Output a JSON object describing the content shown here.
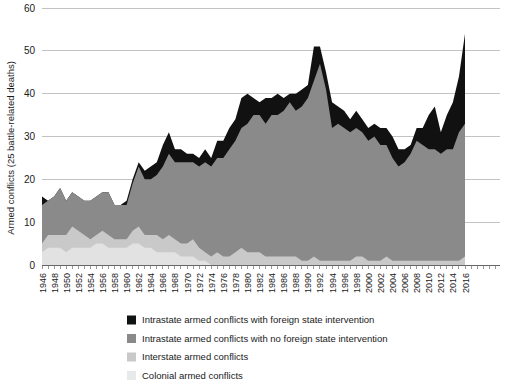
{
  "chart_data": {
    "type": "area",
    "stacked": true,
    "title": "",
    "xlabel": "",
    "ylabel": "Armed conflicts (25 battle-related deaths)",
    "ylim": [
      0,
      60
    ],
    "yticks": [
      0,
      10,
      20,
      30,
      40,
      50,
      60
    ],
    "xlim": [
      1946,
      2017
    ],
    "grid": "horizontal",
    "legend_position": "bottom-left",
    "x": [
      1946,
      1947,
      1948,
      1949,
      1950,
      1951,
      1952,
      1953,
      1954,
      1955,
      1956,
      1957,
      1958,
      1959,
      1960,
      1961,
      1962,
      1963,
      1964,
      1965,
      1966,
      1967,
      1968,
      1969,
      1970,
      1971,
      1972,
      1973,
      1974,
      1975,
      1976,
      1977,
      1978,
      1979,
      1980,
      1981,
      1982,
      1983,
      1984,
      1985,
      1986,
      1987,
      1988,
      1989,
      1990,
      1991,
      1992,
      1993,
      1994,
      1995,
      1996,
      1997,
      1998,
      1999,
      2000,
      2001,
      2002,
      2003,
      2004,
      2005,
      2006,
      2007,
      2008,
      2009,
      2010,
      2011,
      2012,
      2013,
      2014,
      2015,
      2016
    ],
    "xtick_labels": [
      "1946",
      "1948",
      "1950",
      "1952",
      "1954",
      "1956",
      "1958",
      "1960",
      "1962",
      "1964",
      "1966",
      "1968",
      "1970",
      "1972",
      "1974",
      "1976",
      "1978",
      "1980",
      "1982",
      "1984",
      "1986",
      "1988",
      "1990",
      "1992",
      "1994",
      "1996",
      "1998",
      "2000",
      "2002",
      "2004",
      "2006",
      "2008",
      "2010",
      "2012",
      "2014",
      "2016"
    ],
    "series": [
      {
        "name": "Colonial armed conflicts",
        "color": "#e2e2e2",
        "order": 1,
        "values": [
          3,
          4,
          4,
          4,
          3,
          4,
          4,
          4,
          4,
          5,
          5,
          4,
          4,
          4,
          4,
          5,
          5,
          4,
          4,
          3,
          3,
          3,
          3,
          2,
          2,
          2,
          1,
          1,
          0,
          0,
          0,
          0,
          0,
          0,
          0,
          0,
          0,
          0,
          0,
          0,
          0,
          0,
          0,
          0,
          0,
          0,
          0,
          0,
          0,
          0,
          0,
          0,
          0,
          0,
          0,
          0,
          0,
          0,
          0,
          0,
          0,
          0,
          0,
          0,
          0,
          0,
          0,
          0,
          0,
          0,
          0
        ]
      },
      {
        "name": "Interstate armed conflicts",
        "color": "#c9c9c9",
        "order": 2,
        "values": [
          2,
          3,
          3,
          3,
          4,
          5,
          4,
          3,
          2,
          2,
          3,
          3,
          2,
          2,
          2,
          3,
          4,
          3,
          3,
          4,
          3,
          4,
          3,
          3,
          3,
          4,
          3,
          2,
          2,
          3,
          2,
          2,
          3,
          4,
          3,
          3,
          3,
          2,
          2,
          2,
          2,
          2,
          2,
          1,
          1,
          2,
          1,
          1,
          1,
          1,
          1,
          1,
          2,
          2,
          1,
          1,
          1,
          2,
          1,
          1,
          1,
          1,
          1,
          1,
          1,
          1,
          1,
          1,
          1,
          1,
          2
        ]
      },
      {
        "name": "Intrastate armed conflicts with no foreign state intervention",
        "color": "#8a8a8a",
        "order": 3,
        "values": [
          9,
          8,
          9,
          11,
          8,
          8,
          8,
          8,
          9,
          9,
          9,
          10,
          8,
          8,
          8,
          11,
          14,
          13,
          13,
          14,
          17,
          19,
          18,
          19,
          19,
          18,
          19,
          21,
          21,
          22,
          23,
          25,
          26,
          28,
          30,
          32,
          32,
          31,
          33,
          33,
          34,
          36,
          34,
          36,
          38,
          41,
          46,
          40,
          31,
          32,
          31,
          30,
          30,
          29,
          28,
          29,
          27,
          26,
          24,
          22,
          23,
          25,
          28,
          27,
          26,
          26,
          25,
          26,
          26,
          30,
          31
        ]
      },
      {
        "name": "Intrastate armed conflicts with foreign state intervention",
        "color": "#111111",
        "order": 4,
        "values": [
          2,
          0,
          0,
          0,
          0,
          0,
          0,
          0,
          0,
          0,
          0,
          0,
          0,
          0,
          1,
          1,
          1,
          2,
          3,
          3,
          5,
          5,
          3,
          3,
          2,
          2,
          2,
          3,
          2,
          4,
          4,
          5,
          5,
          7,
          7,
          4,
          3,
          6,
          4,
          5,
          3,
          2,
          4,
          4,
          3,
          8,
          4,
          4,
          6,
          4,
          4,
          3,
          4,
          3,
          3,
          3,
          4,
          4,
          5,
          4,
          3,
          2,
          3,
          4,
          8,
          10,
          5,
          8,
          11,
          13,
          21
        ]
      }
    ]
  },
  "legend": {
    "items": [
      {
        "label": "Intrastate armed conflicts with foreign state intervention",
        "color": "#111111"
      },
      {
        "label": "Intrastate armed conflicts with no foreign state intervention",
        "color": "#8a8a8a"
      },
      {
        "label": "Interstate armed conflicts",
        "color": "#c9c9c9"
      },
      {
        "label": "Colonial armed conflicts",
        "color": "#e9e9e9"
      }
    ]
  }
}
